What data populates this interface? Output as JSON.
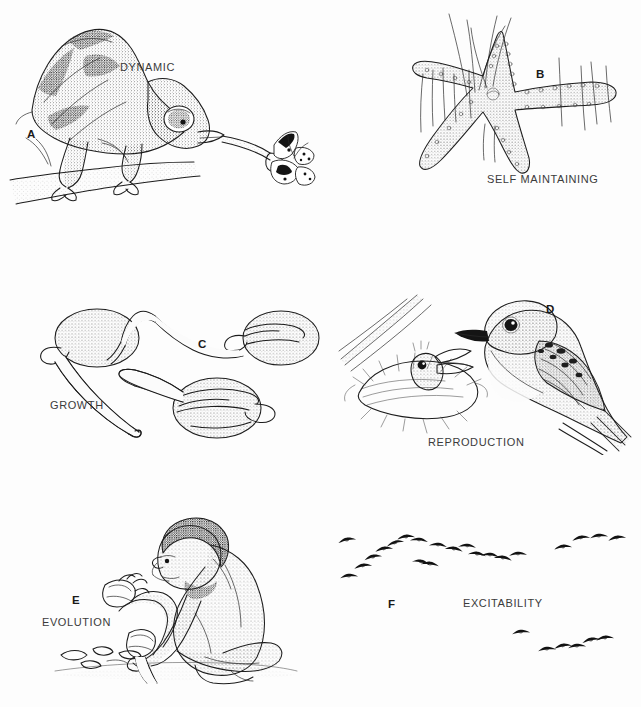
{
  "figure": {
    "background_color": "#fdfdfd",
    "ink_color": "#1c1c1c",
    "width": 641,
    "height": 707,
    "style": "black-and-white stippled pen-and-ink scientific illustration"
  },
  "panels": [
    {
      "letter": "A",
      "caption": "DYNAMIC",
      "subject": "chameleon on a branch catching a butterfly with its extended tongue",
      "icon": "chameleon-illustration"
    },
    {
      "letter": "B",
      "caption": "SELF MAINTAINING",
      "subject": "sea star (starfish) among blades of sea grass",
      "icon": "starfish-illustration"
    },
    {
      "letter": "C",
      "caption": "GROWTH",
      "subject": "three germinating bean seeds with emerging radicles",
      "icon": "germinating-seed-illustration"
    },
    {
      "letter": "D",
      "caption": "REPRODUCTION",
      "subject": "adult bird beside nestling chick in a nest",
      "icon": "bird-nest-illustration"
    },
    {
      "letter": "E",
      "caption": "EVOLUTION",
      "subject": "early hominid kneeling while knapping a stone tool",
      "icon": "hominid-toolmaker-illustration"
    },
    {
      "letter": "F",
      "caption": "EXCITABILITY",
      "subject": "flocks of birds flying in V formation",
      "icon": "bird-flock-illustration"
    }
  ]
}
